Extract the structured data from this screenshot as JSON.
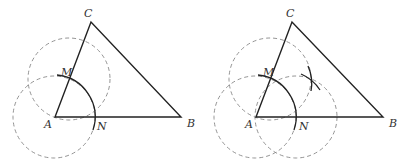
{
  "figures": [
    {
      "id": "left",
      "labels": {
        "A": "A",
        "B": "B",
        "C": "C",
        "M": "M",
        "N": "N"
      },
      "points": {
        "A": [
          55,
          117
        ],
        "B": [
          181,
          117
        ],
        "C": [
          91,
          22
        ],
        "M": [
          69,
          79
        ],
        "N": [
          95,
          120
        ]
      },
      "dashed_circles": [
        {
          "center": "A",
          "cx": 54,
          "cy": 117,
          "r": 41
        },
        {
          "center": "M",
          "cx": 69,
          "cy": 79,
          "r": 41
        }
      ]
    },
    {
      "id": "right",
      "labels": {
        "A": "A",
        "B": "B",
        "C": "C",
        "M": "M",
        "N": "N"
      },
      "points": {
        "A": [
          256,
          117
        ],
        "B": [
          383,
          117
        ],
        "C": [
          292,
          22
        ],
        "M": [
          270,
          79
        ],
        "N": [
          296,
          120
        ]
      },
      "dashed_circles": [
        {
          "center": "A",
          "cx": 255,
          "cy": 117,
          "r": 41
        },
        {
          "center": "M",
          "cx": 270,
          "cy": 79,
          "r": 41
        },
        {
          "center": "N",
          "cx": 296,
          "cy": 117,
          "r": 41
        }
      ]
    }
  ]
}
